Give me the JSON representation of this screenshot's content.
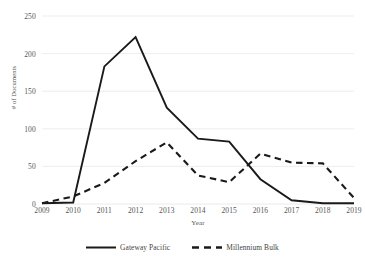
{
  "chart_data": {
    "type": "line",
    "title": "",
    "xlabel": "Year",
    "ylabel": "# of Documents",
    "categories": [
      "2009",
      "2010",
      "2011",
      "2012",
      "2013",
      "2014",
      "2015",
      "2016",
      "2017",
      "2018",
      "2019"
    ],
    "x": [
      2009,
      2010,
      2011,
      2012,
      2013,
      2014,
      2015,
      2016,
      2017,
      2018,
      2019
    ],
    "series": [
      {
        "name": "Gateway Pacific",
        "style": "solid",
        "color": "#1a1a1a",
        "values": [
          1,
          2,
          183,
          222,
          128,
          87,
          83,
          33,
          5,
          1,
          1
        ]
      },
      {
        "name": "Millennium Bulk",
        "style": "dashed",
        "color": "#1a1a1a",
        "values": [
          1,
          10,
          28,
          57,
          82,
          38,
          29,
          67,
          55,
          54,
          8
        ]
      }
    ],
    "ylim": [
      0,
      250
    ],
    "yticks": [
      0,
      50,
      100,
      150,
      200,
      250
    ],
    "ytick_labels": [
      "0",
      "50",
      "100",
      "150",
      "200",
      "250"
    ],
    "grid": "horizontal",
    "grid_color": "#e8e8e8",
    "legend_position": "bottom",
    "background": "#ffffff"
  }
}
